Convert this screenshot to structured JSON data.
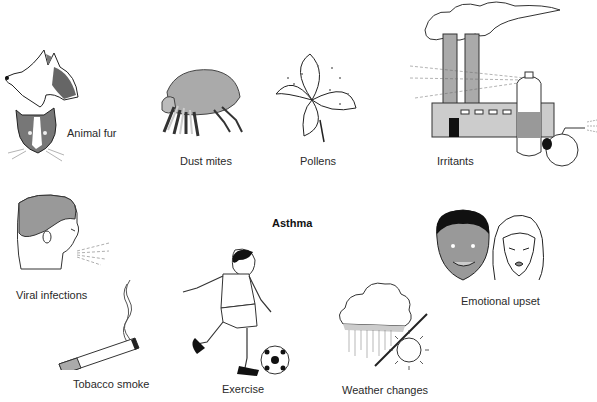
{
  "diagram": {
    "title": "Asthma",
    "triggers": [
      {
        "id": "animal-fur",
        "label": "Animal fur",
        "icon": "dog-cat-icon"
      },
      {
        "id": "dust-mites",
        "label": "Dust mites",
        "icon": "dust-mite-icon"
      },
      {
        "id": "pollens",
        "label": "Pollens",
        "icon": "flower-icon"
      },
      {
        "id": "irritants",
        "label": "Irritants",
        "icon": "factory-spray-icon"
      },
      {
        "id": "viral-infections",
        "label": "Viral infections",
        "icon": "sneezing-person-icon"
      },
      {
        "id": "tobacco-smoke",
        "label": "Tobacco smoke",
        "icon": "cigarette-icon"
      },
      {
        "id": "exercise",
        "label": "Exercise",
        "icon": "soccer-player-icon"
      },
      {
        "id": "weather-changes",
        "label": "Weather changes",
        "icon": "rain-sun-icon"
      },
      {
        "id": "emotional-upset",
        "label": "Emotional upset",
        "icon": "faces-icon"
      }
    ]
  }
}
